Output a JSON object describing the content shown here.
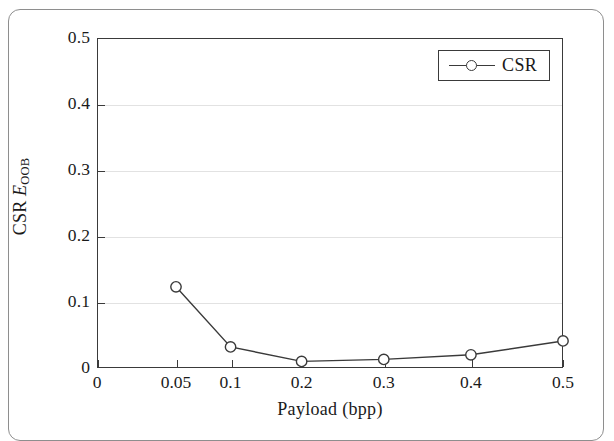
{
  "figure": {
    "frame_border_color": "#8e8e8e",
    "axis_color": "#3a3a3a",
    "grid_color": "#e2e2e2",
    "series_color": "#3a3a3a",
    "background": "#ffffff"
  },
  "chart_data": {
    "type": "line",
    "title": "",
    "xlabel": "Payload (bpp)",
    "ylabel": "CSR E_OOB",
    "ylabel_parts": {
      "prefix": "CSR ",
      "symbol": "E",
      "subscript": "OOB"
    },
    "x": [
      0.05,
      0.1,
      0.2,
      0.3,
      0.4,
      0.5
    ],
    "values": [
      0.123,
      0.032,
      0.01,
      0.013,
      0.02,
      0.041
    ],
    "series": [
      {
        "name": "CSR",
        "marker": "open-circle",
        "values": [
          0.123,
          0.032,
          0.01,
          0.013,
          0.02,
          0.041
        ]
      }
    ],
    "xticks": [
      0,
      0.05,
      0.1,
      0.2,
      0.3,
      0.4,
      0.5
    ],
    "xtick_labels": [
      "0",
      "0.05",
      "0.1",
      "0.2",
      "0.3",
      "0.4",
      "0.5"
    ],
    "xtick_positions": [
      0.0,
      0.1695,
      0.2866,
      0.4391,
      0.6154,
      0.8024,
      1.0
    ],
    "yticks": [
      0,
      0.1,
      0.2,
      0.3,
      0.4,
      0.5
    ],
    "ytick_labels": [
      "0",
      "0.1",
      "0.2",
      "0.3",
      "0.4",
      "0.5"
    ],
    "ylim": [
      0,
      0.5
    ],
    "grid": "horizontal",
    "legend": {
      "position": "upper-right",
      "entries": [
        "CSR"
      ]
    }
  }
}
